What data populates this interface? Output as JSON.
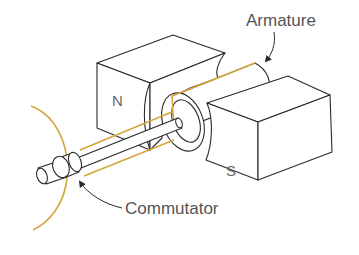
{
  "diagram": {
    "labels": {
      "armature": "Armature",
      "commutator": "Commutator",
      "north_pole": "N",
      "south_pole": "S"
    },
    "components": [
      {
        "name": "north-magnet-block",
        "label": "N"
      },
      {
        "name": "south-magnet-block",
        "label": "S"
      },
      {
        "name": "armature",
        "label": "Armature"
      },
      {
        "name": "commutator",
        "label": "Commutator"
      },
      {
        "name": "shaft"
      },
      {
        "name": "rotation-arc"
      }
    ],
    "colors": {
      "outline": "#2a2a2a",
      "wire": "#d4a63a",
      "label_text": "#555555",
      "background": "#ffffff"
    }
  }
}
